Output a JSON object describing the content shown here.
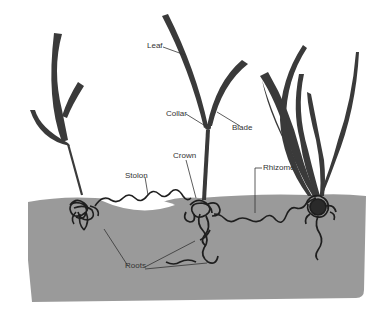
{
  "diagram": {
    "type": "grass plant anatomy",
    "colors": {
      "soil": "#9a9a9a",
      "plant": "#3a3a3a",
      "background": "#ffffff",
      "label": "#333333"
    },
    "labels": {
      "leaf": "Leaf",
      "collar": "Collar",
      "blade": "Blade",
      "crown": "Crown",
      "stolon": "Stolon",
      "rhizome": "Rhizome",
      "roots": "Roots"
    }
  }
}
